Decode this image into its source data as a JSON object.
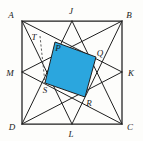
{
  "figure": {
    "canvas": {
      "width": 143,
      "height": 141,
      "background": "#fdfdfb"
    },
    "colors": {
      "shaded_region": "#2BA6DE",
      "line": "#1f1f1f",
      "dashed_line": "#4a4a4a",
      "label": "#1a1a1a"
    },
    "square": {
      "name": "ABCD",
      "corners": [
        {
          "id": "A",
          "label": "A",
          "x": 22,
          "y": 21,
          "label_x": 11,
          "label_y": 18
        },
        {
          "id": "B",
          "label": "B",
          "x": 122,
          "y": 21,
          "label_x": 129,
          "label_y": 18
        },
        {
          "id": "C",
          "label": "C",
          "x": 122,
          "y": 124,
          "label_x": 130,
          "label_y": 130
        },
        {
          "id": "D",
          "label": "D",
          "x": 22,
          "y": 124,
          "label_x": 12,
          "label_y": 130
        }
      ]
    },
    "midpoints": [
      {
        "id": "J",
        "label": "J",
        "x": 72,
        "y": 21,
        "label_x": 71,
        "label_y": 14,
        "edge": "AB"
      },
      {
        "id": "K",
        "label": "K",
        "x": 122,
        "y": 72,
        "label_x": 130,
        "label_y": 76,
        "edge": "BC"
      },
      {
        "id": "L",
        "label": "L",
        "x": 72,
        "y": 124,
        "label_x": 71,
        "label_y": 136,
        "edge": "DC"
      },
      {
        "id": "M",
        "label": "M",
        "x": 22,
        "y": 72,
        "label_x": 10,
        "label_y": 76,
        "edge": "AD"
      }
    ],
    "cevians": [
      {
        "id": "A-K",
        "label": "A to K",
        "x1": 22,
        "y1": 21,
        "x2": 122,
        "y2": 72
      },
      {
        "id": "B-M",
        "label": "B to M",
        "x1": 122,
        "y1": 21,
        "x2": 22,
        "y2": 72
      },
      {
        "id": "D-J",
        "label": "D to J",
        "x1": 22,
        "y1": 124,
        "x2": 72,
        "y2": 21
      },
      {
        "id": "C-J-side",
        "label": "C to J",
        "x1": 122,
        "y1": 124,
        "x2": 72,
        "y2": 21
      },
      {
        "id": "B-L",
        "label": "B to L",
        "x1": 122,
        "y1": 21,
        "x2": 72,
        "y2": 124
      },
      {
        "id": "A-L",
        "label": "A to L",
        "x1": 22,
        "y1": 21,
        "x2": 72,
        "y2": 124
      },
      {
        "id": "D-K",
        "label": "D to K",
        "x1": 22,
        "y1": 124,
        "x2": 122,
        "y2": 72
      },
      {
        "id": "M-C",
        "label": "M to C",
        "x1": 22,
        "y1": 72,
        "x2": 122,
        "y2": 124
      }
    ],
    "shaded_quadrilateral": {
      "id": "PQRS",
      "label": "PQRS",
      "points": "55,42 96,57 85,97 45,83",
      "vertices": [
        {
          "id": "P",
          "label": "P",
          "x": 55,
          "y": 42,
          "label_x": 58,
          "label_y": 50
        },
        {
          "id": "Q",
          "label": "Q",
          "x": 96,
          "y": 57,
          "label_x": 99,
          "label_y": 55
        },
        {
          "id": "R",
          "label": "R",
          "x": 85,
          "y": 97,
          "label_x": 88,
          "label_y": 105
        },
        {
          "id": "S",
          "label": "S",
          "x": 45,
          "y": 83,
          "label_x": 45,
          "label_y": 92
        }
      ]
    },
    "auxiliary": {
      "point_T": {
        "id": "T",
        "label": "T",
        "x": 40,
        "y": 36,
        "label_x": 34,
        "label_y": 39
      },
      "dashed_segment": {
        "id": "T-S-drop",
        "label": "dashed altitude from T",
        "x1": 40,
        "y1": 36,
        "x2": 45,
        "y2": 83
      }
    }
  }
}
